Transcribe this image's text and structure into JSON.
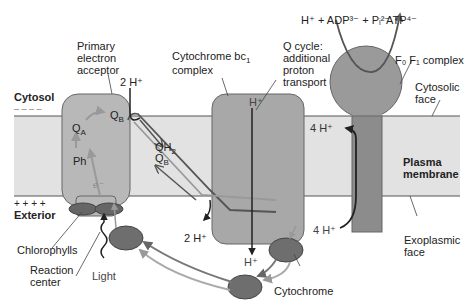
{
  "colors": {
    "background": "#ffffff",
    "membrane": "#e2e2e2",
    "membrane_edge": "#555555",
    "complex_fill": "#a8a8a8",
    "complex_edge": "#6a6a6a",
    "cyt_fill": "#777777",
    "arrow_dark": "#222222",
    "arrow_mid": "#666666",
    "arrow_light": "#a0a0a0"
  },
  "labels": {
    "cytosol": "Cytosol",
    "cytosol_charge": "– – – –",
    "exterior": "Exterior",
    "exterior_charge": "+ + + +",
    "primary_acceptor": [
      "Primary",
      "electron",
      "acceptor"
    ],
    "cyt_bc1": [
      "Cytochrome bc",
      "complex"
    ],
    "cyt_bc1_sub": "1",
    "q_cycle": [
      "Q cycle:",
      "additional",
      "proton",
      "transport"
    ],
    "f0f1": "F₀ F₁ complex",
    "cytosolic_face": [
      "Cytosolic",
      "face"
    ],
    "plasma_membrane": [
      "Plasma",
      "membrane"
    ],
    "exoplasmic_face": [
      "Exoplasmic",
      "face"
    ],
    "chlorophylls": "Chlorophylls",
    "reaction_center": [
      "Reaction",
      "center"
    ],
    "light": "Light",
    "cytochrome": "Cytochrome",
    "reaction_top_left": "H⁺ + ADP³⁻ + Pᵢ²⁻",
    "reaction_top_right": "ATP⁴⁻",
    "h_2_top": "2 H⁺",
    "h_2_bottom": "2 H⁺",
    "h_bc1_top": "H⁺",
    "h_bc1_bottom": "H⁺",
    "h_4_top": "4 H⁺",
    "h_4_bottom": "4 H⁺",
    "qa": "Q",
    "qa_sub": "A",
    "qb": "Q",
    "qb_sub": "B",
    "qb2": "Q",
    "qb2_sub": "B",
    "qh2": "QH",
    "qh2_sub": "2",
    "ph": "Ph",
    "electron": "e⁻"
  }
}
